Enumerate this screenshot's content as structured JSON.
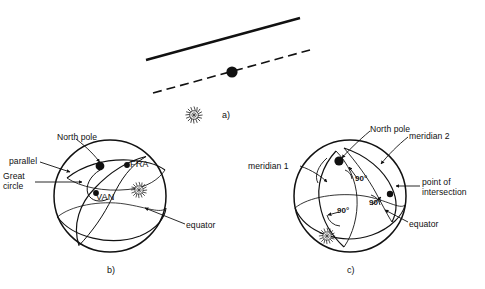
{
  "figure": {
    "background_color": "#ffffff",
    "ink_color": "#111111",
    "panels": [
      {
        "id": "a",
        "label": "a)",
        "caption": "tangent plane and horizon line with satellite point"
      },
      {
        "id": "b",
        "label": "b)",
        "caption": "sphere showing north pole, parallel, great circle and equator"
      },
      {
        "id": "c",
        "label": "c)",
        "caption": "sphere showing two meridians, right angles and point of intersection"
      }
    ]
  },
  "panel_a": {
    "label": "a)",
    "elements": {
      "solid_line": "solid-line",
      "dashed_line": "dashed-line",
      "point": "black-dot",
      "star": "star-burst-icon"
    }
  },
  "panel_b": {
    "label": "b)",
    "labels": {
      "north_pole": "North pole",
      "parallel": "parallel",
      "great_circle_line1": "Great",
      "great_circle_line2": "circle",
      "fra": "FRA",
      "van": "VAN",
      "equator": "equator"
    },
    "elements": {
      "sphere": "sphere-outline",
      "pole_dot": "north-pole-dot",
      "fra_dot": "fra-point-dot",
      "van_dot": "van-point-dot",
      "star": "star-burst-icon"
    }
  },
  "panel_c": {
    "label": "c)",
    "labels": {
      "north_pole": "North pole",
      "meridian_1": "meridian 1",
      "meridian_2": "meridian 2",
      "point_of_intersection_line1": "point of",
      "point_of_intersection_line2": "intersection",
      "equator": "equator",
      "angle_top": "90°",
      "angle_right": "90°",
      "angle_bottom": "90°"
    },
    "elements": {
      "sphere": "sphere-outline",
      "pole_dot": "north-pole-dot",
      "intersection_dot": "intersection-point-dot",
      "star": "star-burst-icon"
    }
  }
}
